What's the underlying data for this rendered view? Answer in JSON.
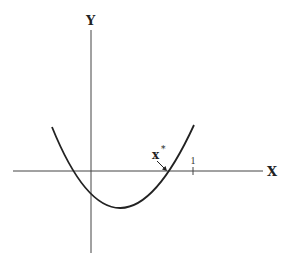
{
  "figure": {
    "type": "function-plot",
    "axes": {
      "x_label": "X",
      "y_label": "Y"
    },
    "ticks": [
      {
        "label": "1",
        "x_value": 1
      }
    ],
    "annotations": [
      {
        "label": "x",
        "superscript": "*",
        "points_to": "right root of curve on x-axis"
      }
    ],
    "curve": {
      "shape": "upward-opening parabola",
      "left_root_approx": -0.2,
      "right_root_approx": 0.75,
      "vertex_x_approx": 0.27
    },
    "colors": {
      "stroke": "#222222",
      "axis": "#444444",
      "background": "#ffffff"
    }
  }
}
